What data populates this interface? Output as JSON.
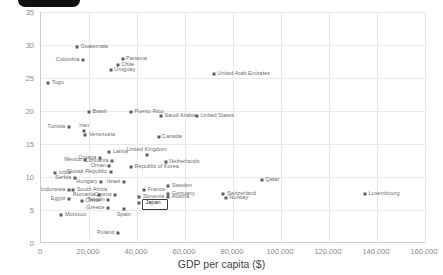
{
  "badge": {
    "text": ""
  },
  "chart_data": {
    "type": "scatter",
    "title": "",
    "xlabel": "GDP per capita ($)",
    "ylabel": "% TEA rate",
    "xlim": [
      0,
      160000
    ],
    "ylim": [
      0,
      35
    ],
    "xticks": [
      "0",
      "20,000",
      "40,000",
      "60,000",
      "80,000",
      "100,000",
      "120,000",
      "140,000",
      "160,000"
    ],
    "xtick_values": [
      0,
      20000,
      40000,
      60000,
      80000,
      100000,
      120000,
      140000,
      160000
    ],
    "yticks": [
      "0",
      "5",
      "10",
      "15",
      "20",
      "25",
      "30",
      "35"
    ],
    "ytick_values": [
      0,
      5,
      10,
      15,
      20,
      25,
      30,
      35
    ],
    "grid": true,
    "legend": "none",
    "selected_point": "Japan",
    "points": [
      {
        "label": "Guatemala",
        "x": 15000,
        "y": 29.7,
        "pos": "right"
      },
      {
        "label": "Colombia",
        "x": 17500,
        "y": 27.8,
        "pos": "left"
      },
      {
        "label": "Panama",
        "x": 34000,
        "y": 27.9,
        "pos": "right"
      },
      {
        "label": "Chile",
        "x": 32000,
        "y": 27.0,
        "pos": "right"
      },
      {
        "label": "Uruguay",
        "x": 29000,
        "y": 26.2,
        "pos": "right"
      },
      {
        "label": "United Arab Emirates",
        "x": 72000,
        "y": 25.6,
        "pos": "right"
      },
      {
        "label": "Togo",
        "x": 3000,
        "y": 24.3,
        "pos": "right"
      },
      {
        "label": "Brasil",
        "x": 20000,
        "y": 19.9,
        "pos": "right"
      },
      {
        "label": "Puerto Rico",
        "x": 37500,
        "y": 19.9,
        "pos": "right"
      },
      {
        "label": "Saudi Arabia",
        "x": 50000,
        "y": 19.3,
        "pos": "right"
      },
      {
        "label": "United States",
        "x": 65000,
        "y": 19.2,
        "pos": "right"
      },
      {
        "label": "Tunisia",
        "x": 11500,
        "y": 17.6,
        "pos": "left"
      },
      {
        "label": "Iran",
        "x": 18000,
        "y": 17.0,
        "pos": "above"
      },
      {
        "label": "Venezuela",
        "x": 18500,
        "y": 16.3,
        "pos": "right"
      },
      {
        "label": "Canada",
        "x": 49000,
        "y": 16.1,
        "pos": "right"
      },
      {
        "label": "Latvia",
        "x": 28500,
        "y": 13.8,
        "pos": "right"
      },
      {
        "label": "United Kingdom",
        "x": 44000,
        "y": 13.4,
        "pos": "above"
      },
      {
        "label": "Croatia",
        "x": 24500,
        "y": 12.9,
        "pos": "left"
      },
      {
        "label": "Mexico",
        "x": 18500,
        "y": 12.6,
        "pos": "left"
      },
      {
        "label": "Lithuania",
        "x": 29500,
        "y": 12.4,
        "pos": "left"
      },
      {
        "label": "Netherlands",
        "x": 52000,
        "y": 12.3,
        "pos": "right"
      },
      {
        "label": "Oman",
        "x": 28500,
        "y": 11.6,
        "pos": "left"
      },
      {
        "label": "Republic of Korea",
        "x": 37500,
        "y": 11.5,
        "pos": "right"
      },
      {
        "label": "India",
        "x": 6000,
        "y": 10.6,
        "pos": "right"
      },
      {
        "label": "Slovak Republic",
        "x": 29000,
        "y": 10.7,
        "pos": "left"
      },
      {
        "label": "Serbia",
        "x": 14000,
        "y": 9.9,
        "pos": "left"
      },
      {
        "label": "Hungary",
        "x": 25000,
        "y": 9.3,
        "pos": "left"
      },
      {
        "label": "Israel",
        "x": 34500,
        "y": 9.3,
        "pos": "left"
      },
      {
        "label": "Qatar",
        "x": 92000,
        "y": 9.5,
        "pos": "right"
      },
      {
        "label": "Sweden",
        "x": 53000,
        "y": 8.6,
        "pos": "right"
      },
      {
        "label": "South Africa",
        "x": 13500,
        "y": 8.1,
        "pos": "right"
      },
      {
        "label": "Indonesia",
        "x": 11500,
        "y": 8.1,
        "pos": "left"
      },
      {
        "label": "France",
        "x": 43000,
        "y": 8.0,
        "pos": "right"
      },
      {
        "label": "Germany",
        "x": 53000,
        "y": 7.5,
        "pos": "right"
      },
      {
        "label": "Switzerland",
        "x": 76000,
        "y": 7.5,
        "pos": "right"
      },
      {
        "label": "Cyprus",
        "x": 31000,
        "y": 7.3,
        "pos": "left"
      },
      {
        "label": "Romania",
        "x": 24000,
        "y": 7.2,
        "pos": "left"
      },
      {
        "label": "Slovenia",
        "x": 41000,
        "y": 7.0,
        "pos": "right"
      },
      {
        "label": "Austria",
        "x": 53000,
        "y": 6.9,
        "pos": "right"
      },
      {
        "label": "Norway",
        "x": 77000,
        "y": 6.8,
        "pos": "right"
      },
      {
        "label": "Luxembourg",
        "x": 135000,
        "y": 7.4,
        "pos": "right"
      },
      {
        "label": "Egypt",
        "x": 11500,
        "y": 6.7,
        "pos": "left"
      },
      {
        "label": "China",
        "x": 17000,
        "y": 6.3,
        "pos": "right"
      },
      {
        "label": "Taiwan",
        "x": 28000,
        "y": 6.5,
        "pos": "left"
      },
      {
        "label": "Japan",
        "x": 41000,
        "y": 6.1,
        "pos": "right"
      },
      {
        "label": "Greece",
        "x": 28000,
        "y": 5.3,
        "pos": "left"
      },
      {
        "label": "Spain",
        "x": 34500,
        "y": 5.2,
        "pos": "below"
      },
      {
        "label": "Morocco",
        "x": 8500,
        "y": 4.3,
        "pos": "right"
      },
      {
        "label": "Poland",
        "x": 32000,
        "y": 1.5,
        "pos": "left"
      }
    ]
  }
}
